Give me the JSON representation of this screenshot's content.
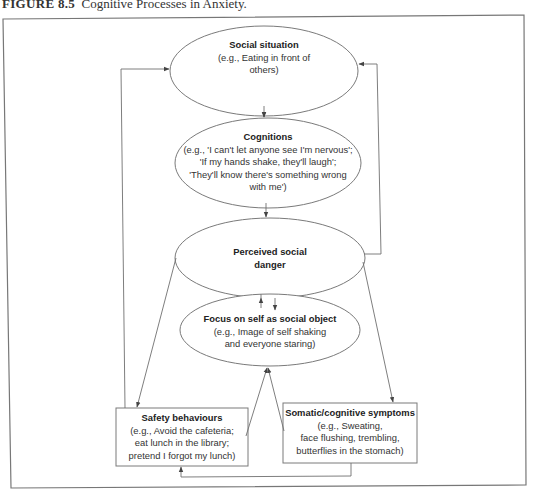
{
  "figure": {
    "label": "FIGURE 8.5",
    "title": "Cognitive Processes in Anxiety."
  },
  "nodes": {
    "social_situation": {
      "title": "Social situation",
      "lines": [
        "(e.g., Eating in front of",
        "others)"
      ]
    },
    "cognitions": {
      "title": "Cognitions",
      "lines": [
        "(e.g., 'I can't let anyone see I'm nervous';",
        "'If my hands shake, they'll laugh';",
        "'They'll know there's something wrong",
        "with me')"
      ]
    },
    "perceived_danger": {
      "title_lines": [
        "Perceived social",
        "danger"
      ]
    },
    "focus_on_self": {
      "title": "Focus on self as social object",
      "lines": [
        "(e.g., Image of self shaking",
        "and everyone staring)"
      ]
    },
    "safety_behaviours": {
      "title": "Safety behaviours",
      "lines": [
        "(e.g., Avoid the cafeteria;",
        "eat lunch in the library;",
        "pretend I forgot my lunch)"
      ]
    },
    "somatic_symptoms": {
      "title": "Somatic/cognitive symptoms",
      "lines": [
        "(e.g., Sweating,",
        "face flushing, trembling,",
        "butterflies in the stomach)"
      ]
    }
  },
  "edges": [
    {
      "from": "social_situation",
      "to": "cognitions"
    },
    {
      "from": "cognitions",
      "to": "perceived_danger"
    },
    {
      "from": "perceived_danger",
      "to": "focus_on_self"
    },
    {
      "from": "focus_on_self",
      "to": "perceived_danger"
    },
    {
      "from": "perceived_danger",
      "to": "safety_behaviours"
    },
    {
      "from": "perceived_danger",
      "to": "somatic_symptoms"
    },
    {
      "from": "safety_behaviours",
      "to": "focus_on_self"
    },
    {
      "from": "somatic_symptoms",
      "to": "focus_on_self"
    },
    {
      "from": "somatic_symptoms",
      "to": "safety_behaviours"
    },
    {
      "from": "safety_behaviours",
      "to": "social_situation"
    },
    {
      "from": "perceived_danger",
      "to": "social_situation"
    }
  ],
  "colors": {
    "line": "#6f6f6f",
    "text": "#333333",
    "background": "#ffffff"
  }
}
